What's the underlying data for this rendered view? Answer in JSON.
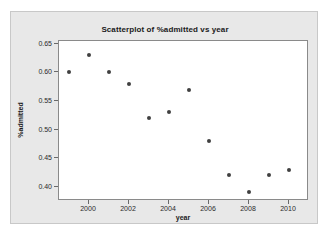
{
  "chart_data": {
    "type": "scatter",
    "title": "Scatterplot of %admitted vs year",
    "xlabel": "year",
    "ylabel": "%admitted",
    "x": [
      1999,
      2000,
      2001,
      2002,
      2003,
      2004,
      2005,
      2006,
      2007,
      2008,
      2009,
      2010
    ],
    "values": [
      0.6,
      0.63,
      0.6,
      0.58,
      0.52,
      0.53,
      0.57,
      0.48,
      0.42,
      0.39,
      0.42,
      0.43
    ],
    "points": [
      {
        "x": 1999,
        "y": 0.6
      },
      {
        "x": 2000,
        "y": 0.63
      },
      {
        "x": 2001,
        "y": 0.6
      },
      {
        "x": 2002,
        "y": 0.58
      },
      {
        "x": 2003,
        "y": 0.52
      },
      {
        "x": 2004,
        "y": 0.53
      },
      {
        "x": 2005,
        "y": 0.57
      },
      {
        "x": 2006,
        "y": 0.48
      },
      {
        "x": 2007,
        "y": 0.42
      },
      {
        "x": 2008,
        "y": 0.39
      },
      {
        "x": 2009,
        "y": 0.42
      },
      {
        "x": 2010,
        "y": 0.43
      }
    ],
    "xlim": [
      1998.5,
      2011.0
    ],
    "ylim": [
      0.375,
      0.655
    ],
    "xticks": [
      2000,
      2002,
      2004,
      2006,
      2008,
      2010
    ],
    "xtick_labels": [
      "2000",
      "2002",
      "2004",
      "2006",
      "2008",
      "2010"
    ],
    "yticks": [
      0.4,
      0.45,
      0.5,
      0.55,
      0.6,
      0.65
    ],
    "ytick_labels": [
      "0.40",
      "0.45",
      "0.50",
      "0.55",
      "0.60",
      "0.65"
    ],
    "grid": false,
    "legend": null,
    "marker_color": "#404040",
    "plot_background": "#ffffff",
    "figure_background": "#e8e8e8"
  }
}
